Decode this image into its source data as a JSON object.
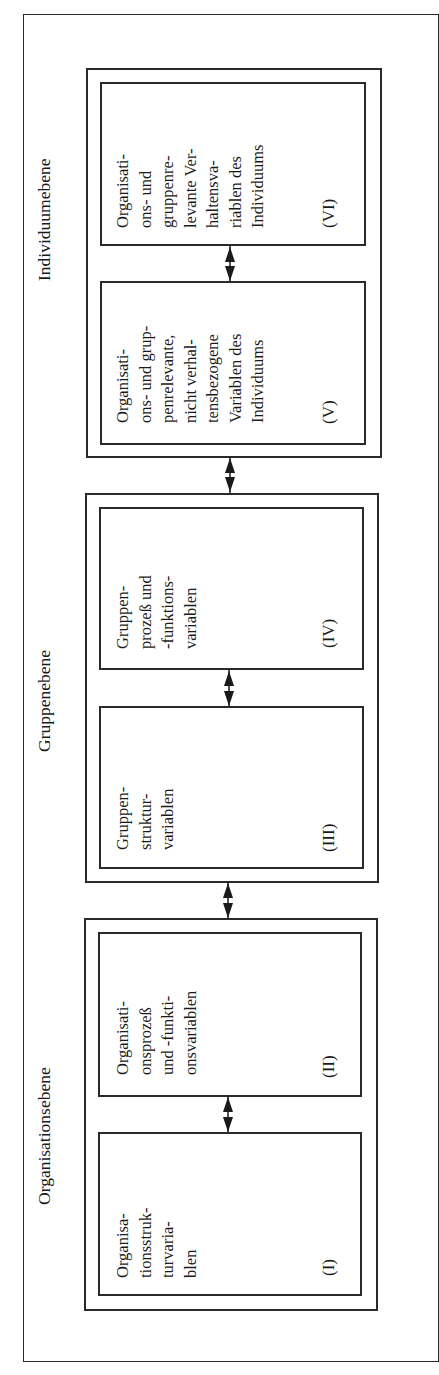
{
  "diagram": {
    "orientation": "rotated-90-ccw",
    "levels": [
      {
        "id": "organisation",
        "label": "Organisationsebene",
        "boxes": [
          {
            "numeral": "(I)",
            "text": "Organisa-\ntionsstruk-\nturvaria-\nblen"
          },
          {
            "numeral": "(II)",
            "text": "Organisati-\nonsprozeß\nund -funkti-\nonsvariablen"
          }
        ]
      },
      {
        "id": "gruppe",
        "label": "Gruppenebene",
        "boxes": [
          {
            "numeral": "(III)",
            "text": "Gruppen-\nstruktur-\nvariablen"
          },
          {
            "numeral": "(IV)",
            "text": "Gruppen-\nprozeß und\n-funktions-\nvariablen"
          }
        ]
      },
      {
        "id": "individuum",
        "label": "Individuumebene",
        "boxes": [
          {
            "numeral": "(V)",
            "text": "Organisati-\nons- und grup-\npenrelevante,\nnicht verhal-\ntensbezogene\nVariablen des\nIndividuums"
          },
          {
            "numeral": "(VI)",
            "text": "Organisati-\nons- und\ngruppenre-\nlevante Ver-\nhaltensva-\nriablen des\nIndividuums"
          }
        ]
      }
    ],
    "connections": [
      {
        "from": "(I)",
        "to": "(II)",
        "type": "bidirectional"
      },
      {
        "from": "Organisationsebene",
        "to": "Gruppenebene",
        "type": "bidirectional"
      },
      {
        "from": "(III)",
        "to": "(IV)",
        "type": "bidirectional"
      },
      {
        "from": "Gruppenebene",
        "to": "Individuumebene",
        "type": "bidirectional"
      },
      {
        "from": "(V)",
        "to": "(VI)",
        "type": "bidirectional"
      }
    ],
    "colors": {
      "line": "#2a2a2a",
      "text": "#1a1a1a",
      "background": "#ffffff"
    }
  }
}
